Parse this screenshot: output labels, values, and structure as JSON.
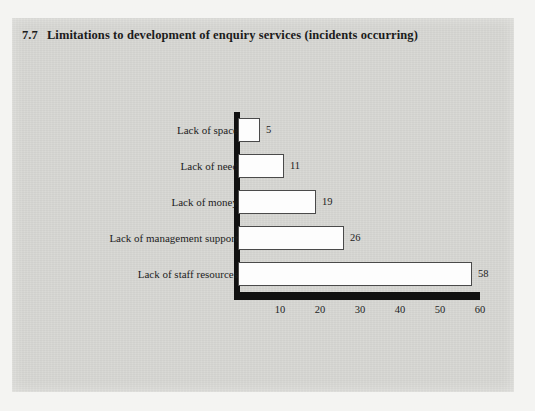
{
  "figure": {
    "number": "7.7",
    "title": "Limitations to development of enquiry services (incidents occurring)"
  },
  "chart_data": {
    "type": "bar",
    "orientation": "horizontal",
    "xlabel": "",
    "ylabel": "",
    "xlim": [
      0,
      60
    ],
    "xticks": [
      "10",
      "20",
      "30",
      "40",
      "50",
      "60"
    ],
    "xtick_values": [
      10,
      20,
      30,
      40,
      50,
      60
    ],
    "grid": false,
    "legend": false,
    "categories": [
      "Lack of space",
      "Lack of need",
      "Lack of money",
      "Lack of management support",
      "Lack of staff resources"
    ],
    "values": [
      5,
      11,
      19,
      26,
      58
    ],
    "data_labels": [
      "5",
      "11",
      "19",
      "26",
      "58"
    ],
    "bar_fill": "#fdfdfd",
    "bar_edge": "#4a4a4a",
    "axis_color": "#111111",
    "background": "#d6d6d2"
  }
}
